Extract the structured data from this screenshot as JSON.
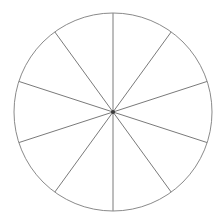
{
  "figure": {
    "name": "fraction-circle",
    "caption": "",
    "background_color": "#ffffff"
  },
  "chart_data": {
    "type": "pie",
    "title": "",
    "subtitle": "",
    "xlabel": "",
    "ylabel": "",
    "legend": [],
    "legend_position": "none",
    "grid": false,
    "labels_shown": false,
    "slice_count": 10,
    "categories": [
      "1",
      "2",
      "3",
      "4",
      "5",
      "6",
      "7",
      "8",
      "9",
      "10"
    ],
    "values": [
      1,
      1,
      1,
      1,
      1,
      1,
      1,
      1,
      1,
      1
    ],
    "percentages": [
      10,
      10,
      10,
      10,
      10,
      10,
      10,
      10,
      10,
      10
    ],
    "slice_angle_degrees": 36,
    "start_angle_degrees": 0,
    "rotation_note": "first radius points straight up (12 o'clock)",
    "annotations": [],
    "tick_labels": [],
    "geometry": {
      "center_x": 113,
      "center_y": 112,
      "radius": 99,
      "canvas_width": 220,
      "canvas_height": 223
    },
    "style": {
      "outline_color": "#8a8a8a",
      "spoke_color": "#7a7a7a",
      "slice_fill": "#ffffff",
      "hub_color": "#3a3a3a",
      "stroke_width": 1,
      "hub_radius": 2
    }
  }
}
